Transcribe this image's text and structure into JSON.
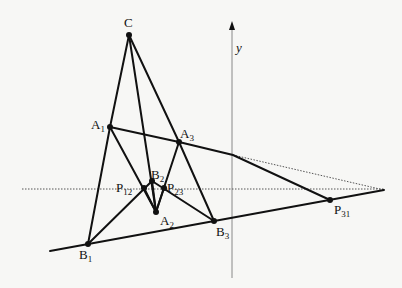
{
  "diagram": {
    "type": "geometric-construction",
    "axis": {
      "label": "y"
    },
    "points": [
      {
        "id": "C",
        "base": "C",
        "sub": ""
      },
      {
        "id": "A1",
        "base": "A",
        "sub": "1"
      },
      {
        "id": "A2",
        "base": "A",
        "sub": "2"
      },
      {
        "id": "A3",
        "base": "A",
        "sub": "3"
      },
      {
        "id": "B1",
        "base": "B",
        "sub": "1"
      },
      {
        "id": "B2",
        "base": "B",
        "sub": "2"
      },
      {
        "id": "B3",
        "base": "B",
        "sub": "3"
      },
      {
        "id": "P12",
        "base": "P",
        "sub": "12"
      },
      {
        "id": "P23",
        "base": "P",
        "sub": "23"
      },
      {
        "id": "P31",
        "base": "P",
        "sub": "31"
      }
    ],
    "colors": {
      "line": "#111111",
      "axis": "#888888",
      "dotted": "#555555",
      "background": "#f7f7f5"
    }
  }
}
